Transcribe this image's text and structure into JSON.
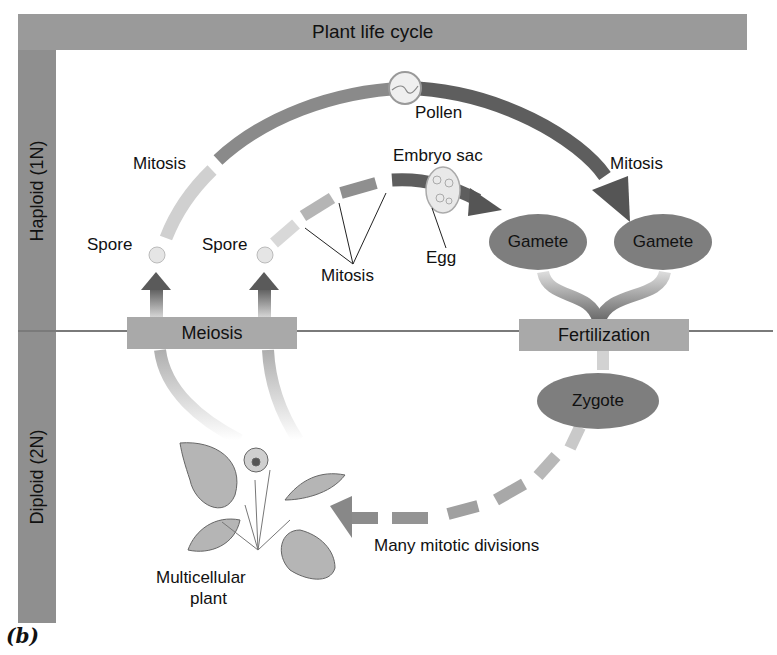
{
  "diagram": {
    "title": "Plant life cycle",
    "phases": {
      "haploid": "Haploid (1N)",
      "diploid": "Diploid (2N)"
    },
    "processes": {
      "meiosis": "Meiosis",
      "fertilization": "Fertilization"
    },
    "structures": {
      "gamete_left": "Gamete",
      "gamete_right": "Gamete",
      "zygote": "Zygote"
    },
    "labels": {
      "pollen": "Pollen",
      "embryo_sac": "Embryo sac",
      "mitosis_left": "Mitosis",
      "mitosis_right": "Mitosis",
      "mitosis_bottom": "Mitosis",
      "spore_left": "Spore",
      "spore_right": "Spore",
      "egg": "Egg",
      "many_mitotic": "Many mitotic divisions",
      "multicellular_line1": "Multicellular",
      "multicellular_line2": "plant"
    },
    "figure_label": "(b)",
    "colors": {
      "bar": "#9a9a9a",
      "arc_dark": "#5e5e5e",
      "arc_light": "#c8c8c8",
      "ellipse": "#7e7e7e",
      "box": "#a9a9a9"
    }
  }
}
